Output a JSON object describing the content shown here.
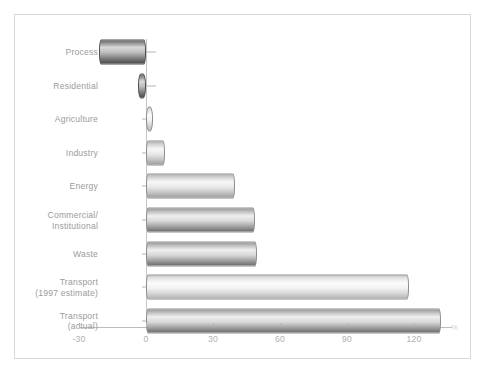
{
  "chart_data": {
    "type": "bar",
    "orientation": "horizontal",
    "title": "",
    "subtitle": "",
    "xlabel": "%",
    "ylabel": "",
    "xlim": [
      -30,
      135
    ],
    "grid": false,
    "legend": "none",
    "unit": "%",
    "categories": [
      "Process",
      "Residential",
      "Agriculture",
      "Industry",
      "Energy",
      "Commercial/\nInstitutional",
      "Waste",
      "Transport\n(1997 estimate)",
      "Transport\n(actual)"
    ],
    "values": [
      -21,
      -3.5,
      3,
      8.5,
      40,
      48.8,
      49.7,
      118,
      132
    ],
    "xticks": [
      -30,
      0,
      30,
      60,
      90,
      120
    ],
    "xtick_labels": [
      "-30",
      "0",
      "30",
      "60",
      "90",
      "120"
    ],
    "series": [
      {
        "name": "Change",
        "values": [
          -21,
          -3.5,
          3,
          8.5,
          40,
          48.8,
          49.7,
          118,
          132
        ]
      }
    ]
  },
  "axis": {
    "percent_symbol": "%"
  },
  "colors": {
    "frame_border": "#d8d8d8",
    "axis_line": "#bdbdbd",
    "label_text": "#9b9b9b",
    "tick_text": "#b0b0b0",
    "bar_border": "#8d8d8d",
    "background": "#ffffff"
  }
}
